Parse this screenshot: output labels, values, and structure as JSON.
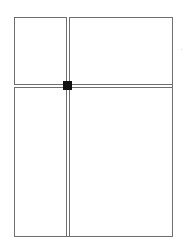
{
  "diagram": {
    "type": "split-pane-layout",
    "colors": {
      "background": "#ffffff",
      "border": "#6e6e6e",
      "handle": "#111111"
    },
    "panes": [
      {
        "id": "top-left"
      },
      {
        "id": "top-right"
      },
      {
        "id": "bottom-left"
      },
      {
        "id": "bottom-right"
      }
    ],
    "splitters": {
      "vertical": {
        "style": "double-line"
      },
      "horizontal": {
        "style": "double-line"
      }
    },
    "handle": {
      "shape": "square",
      "icon": "drag-handle-square"
    }
  }
}
